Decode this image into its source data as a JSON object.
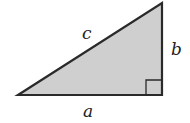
{
  "diagram": {
    "type": "right-triangle",
    "labels": {
      "hypotenuse": "c",
      "vertical_leg": "b",
      "horizontal_leg": "a"
    },
    "right_angle_marker": true,
    "colors": {
      "fill": "#cfcfcf",
      "stroke": "#2a2a2a"
    }
  }
}
